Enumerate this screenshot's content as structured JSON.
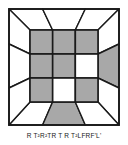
{
  "figure": {
    "kind": "rubiks-cube-top-face-diagram",
    "caption": "R T²R²TR T R T²LFRF'L'",
    "colors": {
      "facelet_filled": "#a8a8a8",
      "facelet_empty": "#ffffff",
      "stroke": "#1a1a1a",
      "background": "#ffffff"
    },
    "geometry": {
      "outer_square": {
        "x": 9,
        "y": 9,
        "w": 110,
        "h": 116
      },
      "inner_square": {
        "x": 30,
        "y": 30,
        "w": 68,
        "h": 72
      },
      "grid": 3
    }
  },
  "top_face": {
    "label": "U face 3x3 grid",
    "rows": [
      [
        {
          "name": "u1",
          "state": "filled"
        },
        {
          "name": "u2",
          "state": "filled"
        },
        {
          "name": "u3",
          "state": "filled"
        }
      ],
      [
        {
          "name": "u4",
          "state": "filled"
        },
        {
          "name": "u5",
          "state": "filled"
        },
        {
          "name": "u6",
          "state": "empty"
        }
      ],
      [
        {
          "name": "u7",
          "state": "filled"
        },
        {
          "name": "u8",
          "state": "empty"
        },
        {
          "name": "u9",
          "state": "filled"
        }
      ]
    ]
  },
  "side_faces": {
    "top": [
      {
        "name": "b1",
        "state": "empty"
      },
      {
        "name": "b2",
        "state": "empty"
      },
      {
        "name": "b3",
        "state": "empty"
      }
    ],
    "right": [
      {
        "name": "r1",
        "state": "empty"
      },
      {
        "name": "r2",
        "state": "filled"
      },
      {
        "name": "r3",
        "state": "empty"
      }
    ],
    "bottom": [
      {
        "name": "f1",
        "state": "empty"
      },
      {
        "name": "f2",
        "state": "filled"
      },
      {
        "name": "f3",
        "state": "empty"
      }
    ],
    "left": [
      {
        "name": "l1",
        "state": "empty"
      },
      {
        "name": "l2",
        "state": "empty"
      },
      {
        "name": "l3",
        "state": "empty"
      }
    ]
  },
  "algorithm": {
    "notation": "R T²R²TR T R T²LFRF'L'",
    "moves": [
      "R",
      "T²",
      "R²",
      "T",
      "R",
      "T",
      "R",
      "T²",
      "L",
      "F",
      "R",
      "F'",
      "L'"
    ]
  }
}
